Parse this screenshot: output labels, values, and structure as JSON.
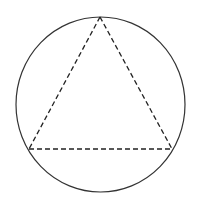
{
  "diagram": {
    "circle": {
      "cx": 100.5,
      "cy": 104.5,
      "rx": 84.5,
      "ry": 87.5,
      "stroke": "#333333",
      "stroke_width": 1.2
    },
    "triangle": {
      "vertices": [
        [
          100,
          17
        ],
        [
          29,
          149
        ],
        [
          172,
          149
        ]
      ],
      "stroke": "#222222",
      "stroke_width": 1.3,
      "dash": "5,3"
    },
    "background": "#ffffff"
  }
}
